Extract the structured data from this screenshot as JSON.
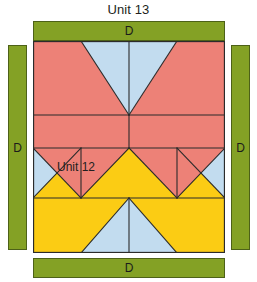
{
  "page": {
    "title": "Unit 13",
    "background": "#ffffff"
  },
  "colors": {
    "sashing_green": "#84a125",
    "sashing_outline": "#4d6118",
    "patch_red": "#ed8177",
    "patch_blue": "#c2dcef",
    "patch_yellow": "#fbcc14",
    "seam_line": "#2b2b2b",
    "text": "#231f20"
  },
  "sashing": {
    "top": {
      "label": "D",
      "orientation": "horizontal"
    },
    "bottom": {
      "label": "D",
      "orientation": "horizontal"
    },
    "left": {
      "label": "D",
      "orientation": "vertical"
    },
    "right": {
      "label": "D",
      "orientation": "vertical"
    }
  },
  "block": {
    "label": "Unit 12",
    "rows": [
      {
        "name": "flying-geese-row-top",
        "patches": [
          "red",
          "blue",
          "blue",
          "red"
        ]
      },
      {
        "name": "solid-red-band",
        "patches": [
          "red",
          "red"
        ]
      },
      {
        "name": "triangle-row",
        "patches": [
          "blue",
          "yellow",
          "red",
          "yellow",
          "red",
          "yellow",
          "blue"
        ]
      },
      {
        "name": "flying-geese-row-bottom",
        "patches": [
          "yellow",
          "blue",
          "blue",
          "yellow"
        ]
      }
    ]
  }
}
